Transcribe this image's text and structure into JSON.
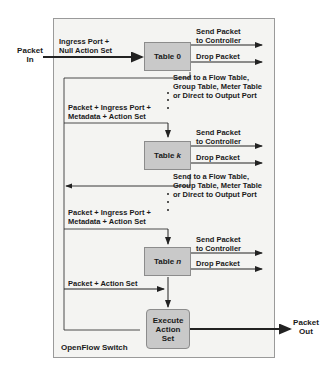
{
  "diagram": {
    "title": "OpenFlow Switch",
    "input": {
      "label_line1": "Packet",
      "label_line2": "In"
    },
    "output": {
      "label_line1": "Packet",
      "label_line2": "Out"
    },
    "entry_label": {
      "line1": "Ingress Port +",
      "line2": "Null Action Set"
    },
    "tables": [
      {
        "name": "Table",
        "index": "0",
        "outputs": {
          "controller": {
            "line1": "Send Packet",
            "line2": "to Controller"
          },
          "drop": "Drop Packet",
          "forward": {
            "line1": "Send to a Flow Table,",
            "line2": "Group Table, Meter Table",
            "line3": "or Direct to Output Port"
          }
        }
      },
      {
        "name": "Table",
        "index": "k",
        "outputs": {
          "controller": {
            "line1": "Send Packet",
            "line2": "to Controller"
          },
          "drop": "Drop Packet",
          "forward": {
            "line1": "Send to a Flow Table,",
            "line2": "Group Table, Meter Table",
            "line3": "or Direct to Output Port"
          }
        }
      },
      {
        "name": "Table",
        "index": "n",
        "outputs": {
          "controller": {
            "line1": "Send Packet",
            "line2": "to Controller"
          },
          "drop": "Drop Packet"
        }
      }
    ],
    "pipeline_labels": [
      {
        "line1": "Packet + Ingress Port +",
        "line2": "Metadata + Action Set"
      },
      {
        "line1": "Packet + Ingress Port +",
        "line2": "Metadata + Action Set"
      },
      {
        "line1": "Packet + Action Set"
      }
    ],
    "execute": {
      "line1": "Execute",
      "line2": "Action",
      "line3": "Set"
    },
    "colors": {
      "frame_border": "#9a9a9a",
      "frame_fill": "#f4f4f2",
      "table_fill": "#c9c9c9",
      "line": "#222222"
    }
  }
}
